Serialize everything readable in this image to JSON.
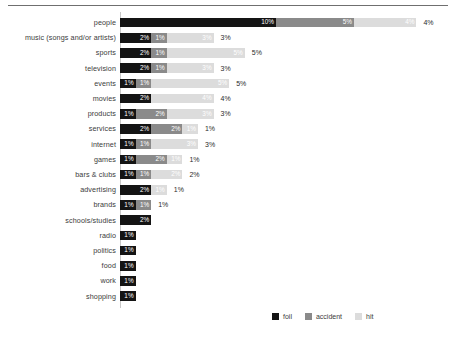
{
  "chart_data": {
    "type": "bar",
    "orientation": "horizontal",
    "stacked": true,
    "title": "",
    "subtitle": "",
    "xlabel": "",
    "ylabel": "",
    "grid": false,
    "legend_position": "bottom-right",
    "xlim": [
      0,
      20
    ],
    "categories": [
      "people",
      "music (songs and/or artists)",
      "sports",
      "television",
      "events",
      "movies",
      "products",
      "services",
      "internet",
      "games",
      "bars & clubs",
      "advertising",
      "brands",
      "schools/studies",
      "radio",
      "politics",
      "food",
      "work",
      "shopping"
    ],
    "series": [
      {
        "name": "foil",
        "color": "#141414",
        "values": [
          10,
          2,
          2,
          2,
          1,
          2,
          1,
          2,
          1,
          1,
          1,
          2,
          1,
          2,
          1,
          1,
          1,
          1,
          1
        ]
      },
      {
        "name": "accident",
        "color": "#8a8a8a",
        "values": [
          5,
          1,
          1,
          1,
          1,
          0,
          2,
          2,
          1,
          2,
          1,
          0,
          1,
          0,
          0,
          0,
          0,
          0,
          0
        ]
      },
      {
        "name": "hit",
        "color": "#dcdcdc",
        "values": [
          4,
          3,
          5,
          3,
          5,
          4,
          3,
          1,
          3,
          1,
          2,
          1,
          0,
          0,
          0,
          0,
          0,
          0,
          0
        ]
      }
    ],
    "segment_labels": [
      [
        "10%",
        "5%",
        "4%"
      ],
      [
        "2%",
        "1%",
        "3%"
      ],
      [
        "2%",
        "1%",
        "5%"
      ],
      [
        "2%",
        "1%",
        "3%"
      ],
      [
        "1%",
        "1%",
        "5%"
      ],
      [
        "2%",
        "",
        "4%"
      ],
      [
        "1%",
        "2%",
        "3%"
      ],
      [
        "2%",
        "2%",
        "1%"
      ],
      [
        "1%",
        "1%",
        "3%"
      ],
      [
        "1%",
        "2%",
        "1%"
      ],
      [
        "1%",
        "1%",
        "2%"
      ],
      [
        "2%",
        "",
        "1%"
      ],
      [
        "1%",
        "1%",
        ""
      ],
      [
        "2%",
        "",
        ""
      ],
      [
        "1%",
        "",
        ""
      ],
      [
        "1%",
        "",
        ""
      ],
      [
        "1%",
        "",
        ""
      ],
      [
        "1%",
        "",
        ""
      ],
      [
        "1%",
        "",
        ""
      ]
    ],
    "tail_labels": [
      "4%",
      "3%",
      "5%",
      "3%",
      "5%",
      "4%",
      "3%",
      "1%",
      "3%",
      "1%",
      "2%",
      "1%",
      "1%",
      "",
      "",
      "",
      "",
      "",
      ""
    ]
  },
  "legend": {
    "items": [
      {
        "label": "foil",
        "color": "#141414"
      },
      {
        "label": "accident",
        "color": "#8a8a8a"
      },
      {
        "label": "hit",
        "color": "#dcdcdc"
      }
    ]
  }
}
